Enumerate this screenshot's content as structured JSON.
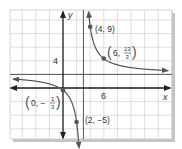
{
  "chart_data": {
    "type": "line",
    "title": "",
    "function": "y = (2x + 1)/(x - 3)",
    "xlabel": "x",
    "ylabel": "y",
    "tick_labels": {
      "x": [
        "6"
      ],
      "y": [
        "4"
      ]
    },
    "grid": true,
    "grid_step_units": 2,
    "xlim": [
      -9,
      16
    ],
    "ylim": [
      -8,
      11.5
    ],
    "asymptotes": {
      "vertical_x": 3,
      "horizontal_y": 2
    },
    "points": [
      {
        "x": 4,
        "y": 9,
        "label": "(4, 9)"
      },
      {
        "x": 6,
        "y": 4.3333,
        "label": "(6, 13/3)"
      },
      {
        "x": 0,
        "y": -0.3333,
        "label": "(0, −1/3)"
      },
      {
        "x": 2,
        "y": -5,
        "label": "(2, −5)"
      }
    ]
  },
  "labels": {
    "x_axis": "x",
    "y_axis": "y",
    "x_tick": "6",
    "y_tick": "4",
    "p1": "(4, 9)",
    "p2_prefix": "6,",
    "p2_num": "13",
    "p2_den": "3",
    "p3_prefix": "0, −",
    "p3_num": "1",
    "p3_den": "3",
    "p4": "(2, −5)"
  },
  "colors": {
    "grid": "#c8c8c8",
    "axis": "#222222",
    "curve": "#555555",
    "asymptote": "#555555",
    "shadow": "#bdbdbd",
    "text": "#333333"
  }
}
